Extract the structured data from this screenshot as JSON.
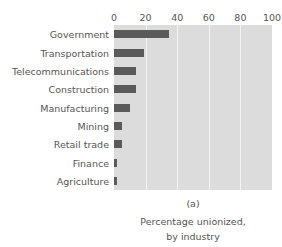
{
  "figure": {
    "panel_label": "(a)",
    "caption_line1": "Percentage unionized,",
    "caption_line2": "by industry",
    "top_clipped_text": "",
    "colors": {
      "plot_background": "#dcdcdc",
      "gridline": "#f4f4f4",
      "bar": "#5a5a5a",
      "text": "#555555",
      "page_background": "#ffffff"
    }
  },
  "chart_data": {
    "type": "bar",
    "orientation": "horizontal",
    "title": "Percentage unionized, by industry",
    "panel": "(a)",
    "xlabel": "",
    "ylabel": "",
    "xlim": [
      0,
      100
    ],
    "grid": true,
    "legend": "none",
    "xticks": [
      0,
      20,
      40,
      60,
      80,
      100
    ],
    "xtick_labels": [
      "0",
      "20",
      "40",
      "60",
      "80",
      "100"
    ],
    "categories": [
      "Government",
      "Transportation",
      "Telecommunications",
      "Construction",
      "Manufacturing",
      "Mining",
      "Retail trade",
      "Finance",
      "Agriculture"
    ],
    "values": [
      35,
      19,
      14,
      14,
      10,
      5,
      5,
      2,
      2
    ]
  }
}
